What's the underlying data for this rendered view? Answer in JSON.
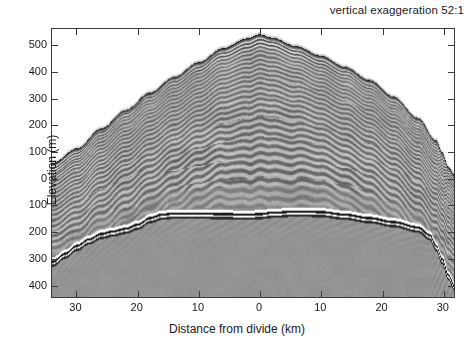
{
  "figure": {
    "title": "vertical exaggeration 52:1",
    "type": "radargram"
  },
  "axes": {
    "ylabel": "Elevation (m)",
    "xlabel": "Distance from divide (km)",
    "y_ticks": [
      {
        "label": "500",
        "value": 500
      },
      {
        "label": "400",
        "value": 400
      },
      {
        "label": "300",
        "value": 300
      },
      {
        "label": "200",
        "value": 200
      },
      {
        "label": "100",
        "value": 100
      },
      {
        "label": "0",
        "value": 0
      },
      {
        "label": "100",
        "value": -100
      },
      {
        "label": "200",
        "value": -200
      },
      {
        "label": "300",
        "value": -300
      },
      {
        "label": "400",
        "value": -400
      }
    ],
    "x_ticks": [
      {
        "label": "30",
        "value": -30
      },
      {
        "label": "20",
        "value": -20
      },
      {
        "label": "10",
        "value": -10
      },
      {
        "label": "0",
        "value": 0
      },
      {
        "label": "10",
        "value": 10
      },
      {
        "label": "20",
        "value": 20
      },
      {
        "label": "30",
        "value": 30
      }
    ]
  },
  "chart_data": {
    "type": "heatmap",
    "title": "vertical exaggeration 52:1",
    "xlabel": "Distance from divide (km)",
    "ylabel": "Elevation (m)",
    "xlim": [
      -34,
      32
    ],
    "ylim": [
      -450,
      560
    ],
    "grid": false,
    "legend": null,
    "colormap": "grayscale",
    "background_value": "uniform gray below bed reflector; white above ice surface",
    "annotations": [
      {
        "text": "vertical exaggeration 52:1",
        "position": "top-right"
      }
    ],
    "series": [
      {
        "name": "ice surface",
        "x": [
          -34,
          -30,
          -26,
          -22,
          -18,
          -14,
          -10,
          -6,
          -2,
          0,
          2,
          6,
          10,
          14,
          18,
          22,
          26,
          29,
          30,
          31,
          32
        ],
        "values": [
          55,
          110,
          185,
          255,
          320,
          380,
          435,
          488,
          525,
          540,
          528,
          496,
          460,
          418,
          368,
          305,
          225,
          140,
          95,
          40,
          10
        ]
      },
      {
        "name": "bed reflector",
        "x": [
          -34,
          -32,
          -30,
          -28,
          -26,
          -24,
          -22,
          -20,
          -18,
          -16,
          -14,
          -10,
          -6,
          -2,
          0,
          2,
          6,
          10,
          14,
          18,
          22,
          26,
          28,
          29,
          30,
          31,
          32
        ],
        "values": [
          -330,
          -300,
          -270,
          -245,
          -225,
          -215,
          -205,
          -190,
          -165,
          -152,
          -148,
          -148,
          -150,
          -152,
          -150,
          -145,
          -140,
          -142,
          -152,
          -165,
          -180,
          -200,
          -230,
          -270,
          -320,
          -380,
          -420
        ]
      }
    ],
    "features": [
      "internal isochrone layering sub-parallel to ice surface",
      "Raymond arch / divide bump in internal layers beneath x = 0",
      "bright double bed reflector",
      "steep bed and surface drop-off at right edge near x = 30 km"
    ]
  }
}
